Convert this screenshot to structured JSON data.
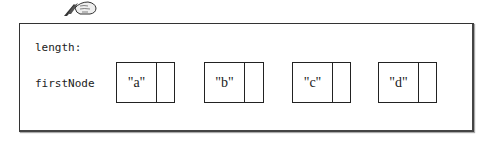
{
  "icon": "hand-writing-quill-icon",
  "fields": [
    {
      "label": "length:"
    },
    {
      "label": "firstNode"
    }
  ],
  "nodes": [
    {
      "data": "\"a\"",
      "next": ""
    },
    {
      "data": "\"b\"",
      "next": ""
    },
    {
      "data": "\"c\"",
      "next": ""
    },
    {
      "data": "\"d\"",
      "next": ""
    }
  ]
}
